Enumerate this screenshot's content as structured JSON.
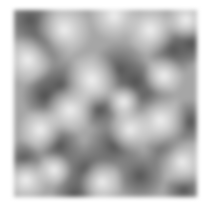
{
  "image": {
    "kind": "grayscale-noise-texture",
    "background": "#ffffff",
    "texture_base_color": "#a6a6a6",
    "texture_bounds": {
      "x": 14,
      "y": 10,
      "width": 183,
      "height": 187
    },
    "dark_blobs": [
      {
        "x": 16,
        "y": 10,
        "r": 22
      },
      {
        "x": 32,
        "y": 32,
        "r": 20
      },
      {
        "x": 46,
        "y": 76,
        "r": 22
      },
      {
        "x": 30,
        "y": 86,
        "r": 18
      },
      {
        "x": 106,
        "y": 60,
        "r": 22
      },
      {
        "x": 122,
        "y": 72,
        "r": 18
      },
      {
        "x": 136,
        "y": 92,
        "r": 20
      },
      {
        "x": 100,
        "y": 136,
        "r": 22
      },
      {
        "x": 72,
        "y": 160,
        "r": 22
      },
      {
        "x": 160,
        "y": 40,
        "r": 20
      },
      {
        "x": 178,
        "y": 34,
        "r": 16
      },
      {
        "x": 156,
        "y": 142,
        "r": 20
      },
      {
        "x": 46,
        "y": 136,
        "r": 18
      },
      {
        "x": 86,
        "y": 100,
        "r": 16
      },
      {
        "x": 126,
        "y": 166,
        "r": 20
      },
      {
        "x": 176,
        "y": 112,
        "r": 18
      },
      {
        "x": 10,
        "y": 150,
        "r": 16
      },
      {
        "x": 60,
        "y": 185,
        "r": 18
      },
      {
        "x": 170,
        "y": 180,
        "r": 16
      }
    ],
    "light_blobs": [
      {
        "x": 50,
        "y": 20,
        "r": 22
      },
      {
        "x": 100,
        "y": 6,
        "r": 20
      },
      {
        "x": 136,
        "y": 20,
        "r": 20
      },
      {
        "x": 78,
        "y": 70,
        "r": 22
      },
      {
        "x": 14,
        "y": 50,
        "r": 20
      },
      {
        "x": 56,
        "y": 100,
        "r": 20
      },
      {
        "x": 12,
        "y": 170,
        "r": 18
      },
      {
        "x": 88,
        "y": 172,
        "r": 18
      },
      {
        "x": 146,
        "y": 110,
        "r": 22
      },
      {
        "x": 168,
        "y": 152,
        "r": 20
      },
      {
        "x": 116,
        "y": 120,
        "r": 18
      },
      {
        "x": 172,
        "y": 10,
        "r": 16
      },
      {
        "x": 26,
        "y": 120,
        "r": 18
      },
      {
        "x": 110,
        "y": 92,
        "r": 14
      },
      {
        "x": 150,
        "y": 66,
        "r": 16
      },
      {
        "x": 40,
        "y": 160,
        "r": 14
      }
    ]
  }
}
